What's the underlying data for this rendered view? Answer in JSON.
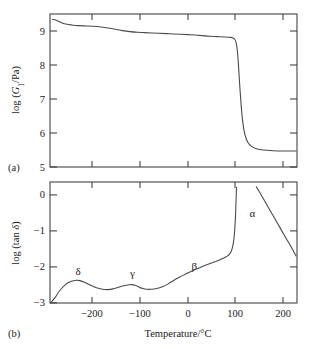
{
  "figure": {
    "panel_a_label": "(a)",
    "panel_b_label": "(b)",
    "xlabel": "Temperature/°C"
  },
  "chart_data": [
    {
      "type": "line",
      "panel": "(a)",
      "title": "",
      "xlabel": "Temperature/°C",
      "ylabel": "log (G₁/Pa)",
      "xlim": [
        -290,
        220
      ],
      "ylim": [
        5,
        9.6
      ],
      "xticks": [
        -200,
        -100,
        0,
        100,
        200
      ],
      "xticklabels": [
        "−200",
        "−100",
        "0",
        "100",
        "200"
      ],
      "yticks": [
        5,
        6,
        7,
        8,
        9
      ],
      "yticklabels": [
        "5",
        "6",
        "7",
        "8",
        "9"
      ],
      "grid": false,
      "legend": "none",
      "description": "Storage modulus versus temperature: glassy plateau near 9.4 slowly decaying to 8.9, then a sharp drop near 100 °C to a rubbery plateau near 5.5",
      "x": [
        -285,
        -275,
        -265,
        -255,
        -245,
        -230,
        -215,
        -200,
        -185,
        -170,
        -155,
        -140,
        -125,
        -110,
        -95,
        -80,
        -65,
        -50,
        -35,
        -20,
        -5,
        10,
        25,
        40,
        55,
        70,
        80,
        88,
        93,
        96,
        99,
        102,
        105,
        108,
        112,
        118,
        126,
        136,
        150,
        170,
        195,
        218
      ],
      "y": [
        9.44,
        9.4,
        9.33,
        9.29,
        9.27,
        9.25,
        9.24,
        9.23,
        9.21,
        9.18,
        9.14,
        9.1,
        9.07,
        9.05,
        9.04,
        9.03,
        9.02,
        9.01,
        9.0,
        8.99,
        8.98,
        8.97,
        8.95,
        8.93,
        8.92,
        8.91,
        8.9,
        8.88,
        8.8,
        8.6,
        8.1,
        7.4,
        6.8,
        6.35,
        6.0,
        5.75,
        5.62,
        5.55,
        5.51,
        5.49,
        5.48,
        5.48
      ]
    },
    {
      "type": "line",
      "panel": "(b)",
      "title": "",
      "xlabel": "Temperature/°C",
      "ylabel": "log (tan δ)",
      "xlim": [
        -290,
        220
      ],
      "ylim": [
        -3,
        0.35
      ],
      "xticks": [
        -200,
        -100,
        0,
        100,
        200
      ],
      "xticklabels": [
        "−200",
        "−100",
        "0",
        "100",
        "200"
      ],
      "yticks": [
        0,
        -1,
        -2,
        -3
      ],
      "yticklabels": [
        "0",
        "−1",
        "−2",
        "−3"
      ],
      "grid": false,
      "legend": "none",
      "description": "Loss tangent versus temperature showing four relaxation peaks labelled delta, gamma, beta and alpha; the alpha peak near 95 °C is clipped by the top of the frame",
      "annotations": [
        {
          "label": "δ",
          "x": -232,
          "y": -2.22
        },
        {
          "label": "γ",
          "x": -120,
          "y": -2.28
        },
        {
          "label": "β",
          "x": 8,
          "y": -2.1
        },
        {
          "label": "α",
          "x": 128,
          "y": -0.62
        }
      ],
      "x": [
        -288,
        -280,
        -270,
        -258,
        -246,
        -236,
        -228,
        -218,
        -206,
        -194,
        -182,
        -170,
        -160,
        -150,
        -140,
        -130,
        -122,
        -114,
        -106,
        -98,
        -90,
        -80,
        -70,
        -58,
        -46,
        -34,
        -22,
        -10,
        2,
        14,
        26,
        38,
        50,
        60,
        68,
        75,
        81,
        86,
        90,
        93,
        95
      ],
      "y": [
        -2.98,
        -2.86,
        -2.66,
        -2.49,
        -2.4,
        -2.37,
        -2.38,
        -2.43,
        -2.51,
        -2.58,
        -2.62,
        -2.63,
        -2.61,
        -2.57,
        -2.53,
        -2.5,
        -2.49,
        -2.51,
        -2.56,
        -2.6,
        -2.62,
        -2.62,
        -2.6,
        -2.55,
        -2.47,
        -2.37,
        -2.28,
        -2.2,
        -2.12,
        -2.05,
        -1.98,
        -1.92,
        -1.86,
        -1.81,
        -1.76,
        -1.71,
        -1.64,
        -1.5,
        -1.2,
        -0.6,
        0.2
      ],
      "alpha_branch_x": [
        136,
        150,
        165,
        180,
        195,
        208,
        218
      ],
      "alpha_branch_y": [
        0.22,
        -0.1,
        -0.45,
        -0.8,
        -1.15,
        -1.45,
        -1.7
      ]
    }
  ]
}
